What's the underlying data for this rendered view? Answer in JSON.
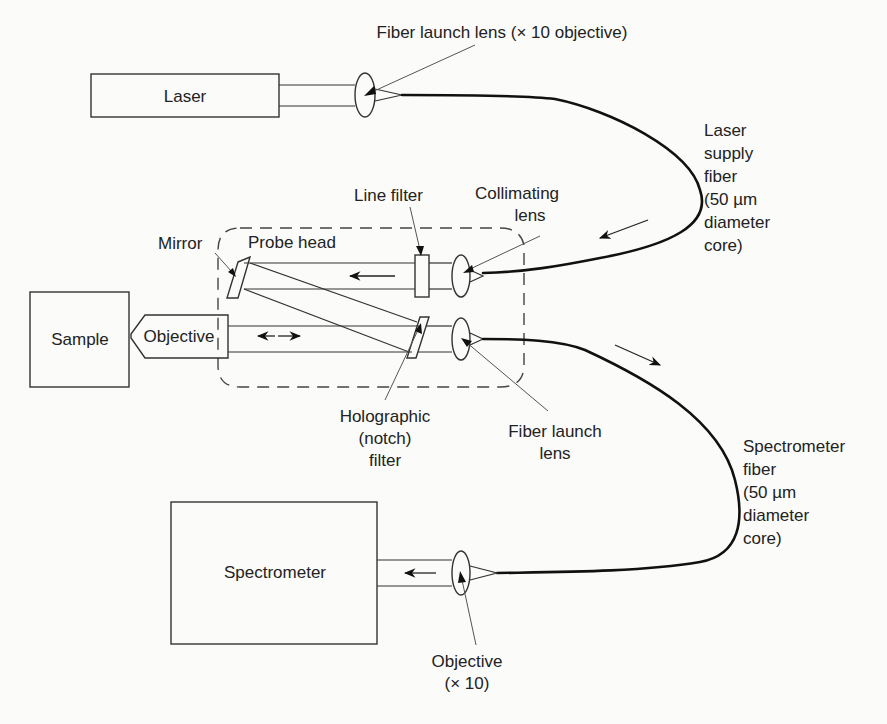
{
  "components": {
    "laser": "Laser",
    "sample": "Sample",
    "objective": "Objective",
    "spectrometer": "Spectrometer",
    "probe_head": "Probe head"
  },
  "labels": {
    "fiber_launch_lens_top": "Fiber launch lens (× 10 objective)",
    "laser_supply_fiber": [
      "Laser",
      "supply",
      "fiber",
      "(50 µm",
      "diameter",
      "core)"
    ],
    "line_filter": "Line filter",
    "collimating_lens": [
      "Collimating",
      "lens"
    ],
    "mirror": "Mirror",
    "holographic_filter": [
      "Holographic",
      "(notch)",
      "filter"
    ],
    "fiber_launch_lens_mid": [
      "Fiber launch",
      "lens"
    ],
    "spectrometer_fiber": [
      "Spectrometer",
      "fiber",
      "(50 µm",
      "diameter",
      "core)"
    ],
    "objective_x10": [
      "Objective",
      "(× 10)"
    ]
  },
  "colors": {
    "background": "#fbfbf9",
    "line": "#333333",
    "fiber": "#111111",
    "text": "#222222"
  }
}
